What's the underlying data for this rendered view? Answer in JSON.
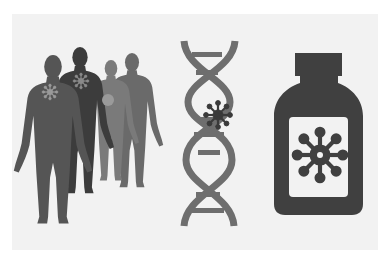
{
  "illustration": {
    "description": "Three icons: group of human silhouettes with virus markers, DNA double helix with virus, medicine bottle with virus label",
    "colors": {
      "background_outer": "#ffffff",
      "background_panel": "#f2f2f2",
      "figure_dark": "#3c3c3c",
      "figure_mid": "#555555",
      "figure_light": "#7a7a7a",
      "virus_marker_light": "#9a9a9a",
      "dna": "#6e6e6e",
      "virus_dark": "#3a3a3a",
      "bottle": "#404040",
      "label": "#f2f2f2"
    },
    "elements": [
      {
        "name": "people-group",
        "count": 4
      },
      {
        "name": "dna-helix"
      },
      {
        "name": "medicine-bottle"
      }
    ]
  }
}
